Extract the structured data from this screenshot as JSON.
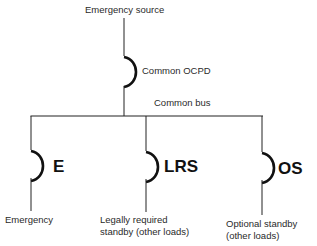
{
  "diagram": {
    "source_label": "Emergency source",
    "common_ocpd_label": "Common OCPD",
    "common_bus_label": "Common bus",
    "branches": [
      {
        "code": "E",
        "description_line1": "Emergency",
        "description_line2": ""
      },
      {
        "code": "LRS",
        "description_line1": "Legally required",
        "description_line2": "standby (other loads)"
      },
      {
        "code": "OS",
        "description_line1": "Optional standby",
        "description_line2": "(other loads)"
      }
    ]
  }
}
